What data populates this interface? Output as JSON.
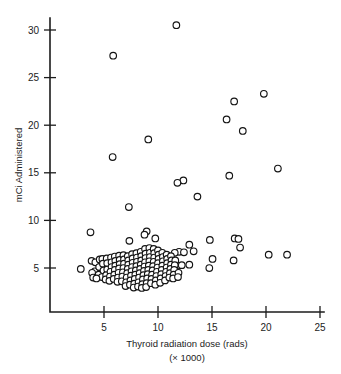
{
  "figure": {
    "background_color": "#ffffff",
    "ink_color": "#1c1c1c",
    "marker_fill": "#ffffff",
    "marker_stroke": "#141414"
  },
  "chart_data": {
    "type": "scatter",
    "title": "",
    "xlabel": "Thyroid radiation dose (rads)",
    "xlabel_sub": "(× 1000)",
    "ylabel": "mCi Administered",
    "xlim": [
      0,
      25
    ],
    "ylim": [
      0,
      32
    ],
    "grid": false,
    "legend": null,
    "xticks": [
      5,
      10,
      15,
      20,
      25
    ],
    "xticklabels": [
      "5",
      "10",
      "15",
      "20",
      "25"
    ],
    "yticks": [
      5,
      10,
      15,
      20,
      25,
      30
    ],
    "yticklabels": [
      "5",
      "10",
      "15",
      "20",
      "25",
      "30"
    ],
    "marker": "open-circle",
    "n_points": 178,
    "points": [
      [
        11.7,
        30.5
      ],
      [
        5.85,
        27.3
      ],
      [
        19.8,
        23.3
      ],
      [
        17.05,
        22.5
      ],
      [
        16.35,
        20.6
      ],
      [
        17.85,
        19.4
      ],
      [
        9.1,
        18.5
      ],
      [
        5.8,
        16.65
      ],
      [
        21.1,
        15.45
      ],
      [
        16.6,
        14.7
      ],
      [
        12.35,
        14.2
      ],
      [
        11.8,
        13.95
      ],
      [
        13.65,
        12.5
      ],
      [
        7.3,
        11.4
      ],
      [
        8.95,
        8.85
      ],
      [
        3.75,
        8.75
      ],
      [
        8.75,
        8.5
      ],
      [
        9.75,
        8.1
      ],
      [
        14.8,
        7.95
      ],
      [
        17.1,
        8.1
      ],
      [
        17.45,
        8.05
      ],
      [
        7.35,
        7.85
      ],
      [
        12.9,
        7.45
      ],
      [
        17.6,
        7.15
      ],
      [
        13.3,
        6.75
      ],
      [
        11.95,
        6.7
      ],
      [
        12.4,
        6.65
      ],
      [
        11.55,
        6.6
      ],
      [
        21.95,
        6.4
      ],
      [
        20.25,
        6.4
      ],
      [
        15.05,
        5.95
      ],
      [
        17.0,
        5.8
      ],
      [
        12.9,
        5.35
      ],
      [
        11.85,
        5.25
      ],
      [
        14.75,
        5.0
      ],
      [
        2.85,
        4.9
      ],
      [
        3.85,
        5.75
      ],
      [
        4.2,
        5.6
      ],
      [
        4.15,
        4.65
      ],
      [
        3.9,
        4.5
      ],
      [
        4.6,
        5.9
      ],
      [
        4.55,
        5.1
      ],
      [
        4.5,
        4.3
      ],
      [
        4.85,
        5.95
      ],
      [
        4.9,
        5.45
      ],
      [
        4.95,
        4.75
      ],
      [
        4.8,
        4.05
      ],
      [
        5.25,
        6.0
      ],
      [
        5.3,
        5.5
      ],
      [
        5.3,
        4.85
      ],
      [
        5.2,
        4.25
      ],
      [
        5.15,
        3.8
      ],
      [
        5.65,
        6.1
      ],
      [
        5.7,
        5.6
      ],
      [
        5.7,
        5.1
      ],
      [
        5.6,
        4.6
      ],
      [
        5.55,
        4.1
      ],
      [
        5.5,
        3.65
      ],
      [
        6.0,
        6.2
      ],
      [
        6.05,
        5.75
      ],
      [
        6.05,
        5.25
      ],
      [
        6.0,
        4.8
      ],
      [
        5.95,
        4.3
      ],
      [
        5.9,
        3.85
      ],
      [
        6.4,
        6.3
      ],
      [
        6.45,
        5.85
      ],
      [
        6.45,
        5.4
      ],
      [
        6.4,
        4.95
      ],
      [
        6.35,
        4.5
      ],
      [
        6.3,
        4.0
      ],
      [
        6.25,
        3.55
      ],
      [
        6.8,
        6.35
      ],
      [
        6.85,
        5.9
      ],
      [
        6.85,
        5.45
      ],
      [
        6.8,
        5.0
      ],
      [
        6.75,
        4.55
      ],
      [
        6.7,
        4.1
      ],
      [
        6.65,
        3.6
      ],
      [
        7.2,
        6.25
      ],
      [
        7.25,
        5.8
      ],
      [
        7.25,
        5.35
      ],
      [
        7.2,
        4.9
      ],
      [
        7.15,
        4.45
      ],
      [
        7.1,
        4.0
      ],
      [
        7.05,
        3.5
      ],
      [
        7.0,
        3.1
      ],
      [
        7.6,
        6.45
      ],
      [
        7.65,
        6.0
      ],
      [
        7.65,
        5.55
      ],
      [
        7.6,
        5.1
      ],
      [
        7.55,
        4.65
      ],
      [
        7.5,
        4.2
      ],
      [
        7.45,
        3.7
      ],
      [
        7.4,
        3.25
      ],
      [
        8.0,
        6.55
      ],
      [
        8.05,
        6.1
      ],
      [
        8.05,
        5.65
      ],
      [
        8.0,
        5.2
      ],
      [
        7.95,
        4.75
      ],
      [
        7.9,
        4.3
      ],
      [
        7.85,
        3.85
      ],
      [
        7.8,
        3.35
      ],
      [
        7.75,
        2.95
      ],
      [
        8.4,
        6.7
      ],
      [
        8.45,
        6.25
      ],
      [
        8.45,
        5.8
      ],
      [
        8.4,
        5.35
      ],
      [
        8.35,
        4.9
      ],
      [
        8.3,
        4.45
      ],
      [
        8.25,
        4.0
      ],
      [
        8.2,
        3.5
      ],
      [
        8.15,
        3.05
      ],
      [
        8.8,
        7.0
      ],
      [
        8.85,
        6.5
      ],
      [
        8.85,
        6.05
      ],
      [
        8.8,
        5.6
      ],
      [
        8.75,
        5.15
      ],
      [
        8.7,
        4.7
      ],
      [
        8.65,
        4.25
      ],
      [
        8.6,
        3.8
      ],
      [
        8.55,
        3.3
      ],
      [
        8.5,
        2.9
      ],
      [
        9.2,
        7.1
      ],
      [
        9.25,
        6.6
      ],
      [
        9.25,
        6.15
      ],
      [
        9.2,
        5.7
      ],
      [
        9.15,
        5.25
      ],
      [
        9.1,
        4.8
      ],
      [
        9.05,
        4.35
      ],
      [
        9.0,
        3.9
      ],
      [
        8.95,
        3.4
      ],
      [
        8.9,
        3.0
      ],
      [
        9.6,
        7.0
      ],
      [
        9.65,
        6.55
      ],
      [
        9.65,
        6.1
      ],
      [
        9.6,
        5.65
      ],
      [
        9.55,
        5.2
      ],
      [
        9.5,
        4.75
      ],
      [
        9.45,
        4.3
      ],
      [
        9.4,
        3.85
      ],
      [
        9.35,
        3.4
      ],
      [
        10.0,
        6.85
      ],
      [
        10.05,
        6.4
      ],
      [
        10.05,
        5.95
      ],
      [
        10.0,
        5.5
      ],
      [
        9.95,
        5.05
      ],
      [
        9.9,
        4.6
      ],
      [
        9.85,
        4.15
      ],
      [
        9.8,
        3.7
      ],
      [
        9.75,
        3.25
      ],
      [
        10.4,
        6.6
      ],
      [
        10.45,
        6.15
      ],
      [
        10.45,
        5.7
      ],
      [
        10.4,
        5.25
      ],
      [
        10.35,
        4.8
      ],
      [
        10.3,
        4.35
      ],
      [
        10.25,
        3.9
      ],
      [
        10.2,
        3.45
      ],
      [
        10.8,
        6.4
      ],
      [
        10.85,
        5.95
      ],
      [
        10.85,
        5.5
      ],
      [
        10.8,
        5.05
      ],
      [
        10.75,
        4.6
      ],
      [
        10.7,
        4.15
      ],
      [
        10.65,
        3.7
      ],
      [
        11.2,
        6.25
      ],
      [
        11.25,
        5.8
      ],
      [
        11.2,
        5.35
      ],
      [
        11.15,
        4.9
      ],
      [
        11.1,
        4.45
      ],
      [
        11.05,
        4.0
      ],
      [
        11.6,
        5.8
      ],
      [
        11.55,
        5.3
      ],
      [
        11.5,
        4.8
      ],
      [
        11.45,
        4.3
      ],
      [
        11.4,
        3.9
      ],
      [
        11.9,
        4.5
      ],
      [
        11.85,
        4.05
      ],
      [
        4.0,
        4.0
      ],
      [
        4.3,
        3.9
      ],
      [
        12.2,
        5.3
      ]
    ]
  }
}
